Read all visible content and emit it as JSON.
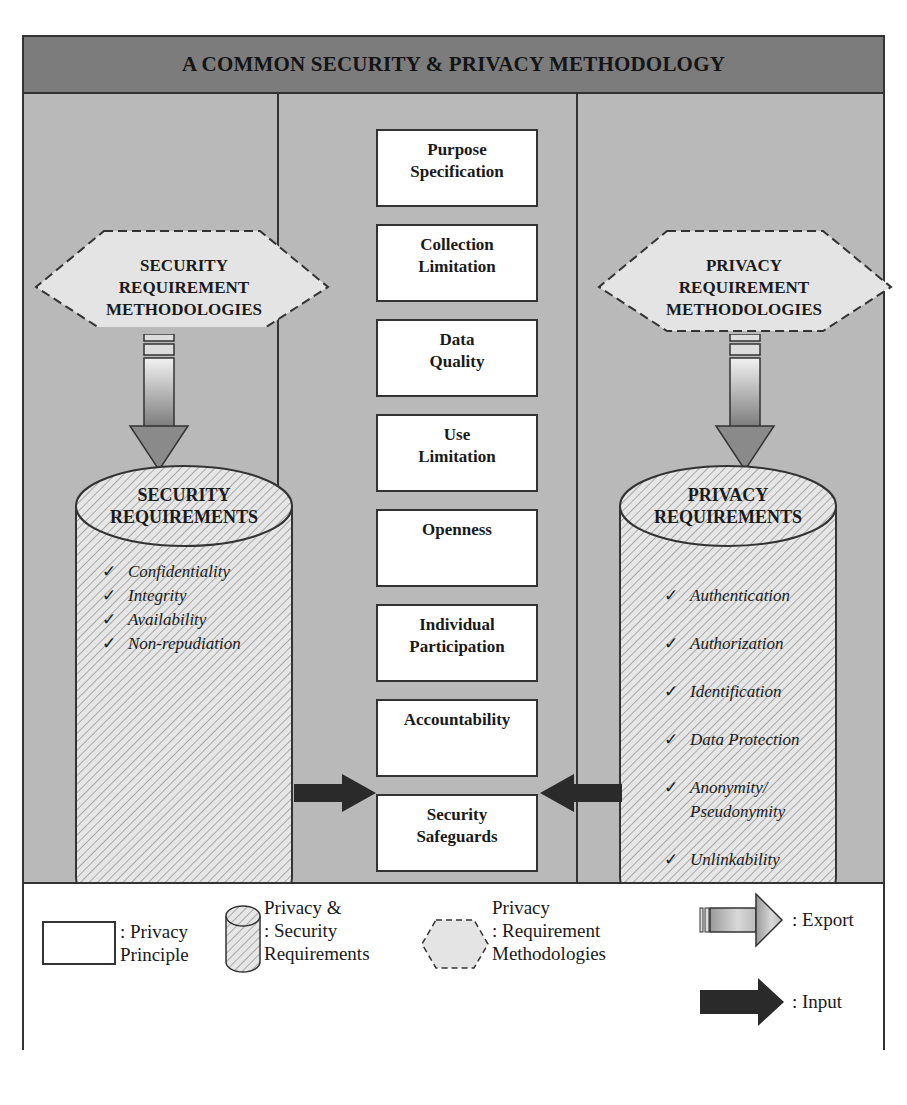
{
  "title": "A COMMON SECURITY & PRIVACY METHODOLOGY",
  "left_column": {
    "methodology_label": [
      "SECURITY",
      "REQUIREMENT",
      "METHODOLOGIES"
    ],
    "requirements_title": [
      "SECURITY",
      "REQUIREMENTS"
    ],
    "requirements": [
      "Confidentiality",
      "Integrity",
      "Availability",
      "Non-repudiation"
    ]
  },
  "center_column": {
    "principles": [
      [
        "Purpose",
        "Specification"
      ],
      [
        "Collection",
        "Limitation"
      ],
      [
        "Data",
        "Quality"
      ],
      [
        "Use",
        "Limitation"
      ],
      [
        "Openness",
        ""
      ],
      [
        "Individual",
        "Participation"
      ],
      [
        "Accountability",
        ""
      ],
      [
        "Security",
        "Safeguards"
      ]
    ]
  },
  "right_column": {
    "methodology_label": [
      "PRIVACY",
      "REQUIREMENT",
      "METHODOLOGIES"
    ],
    "requirements_title": [
      "PRIVACY",
      "REQUIREMENTS"
    ],
    "requirements": [
      "Authentication",
      "Authorization",
      "Identification",
      "Data Protection",
      "Anonymity/\nPseudonymity",
      "Unlinkability",
      "Unobservability"
    ]
  },
  "check_glyph": "✓",
  "legend": {
    "privacy_principle": [
      ": Privacy",
      "Principle"
    ],
    "requirements": [
      "Privacy &",
      ": Security",
      "Requirements"
    ],
    "methodologies": [
      "Privacy",
      ": Requirement",
      "Methodologies"
    ],
    "export": ": Export",
    "input": ": Input"
  },
  "colors": {
    "header": "#7c7c7c",
    "body_bg": "#b9b9b9",
    "hexagon_fill": "#e4e4e4",
    "border": "#333333",
    "input_arrow": "#2a2a2a"
  }
}
